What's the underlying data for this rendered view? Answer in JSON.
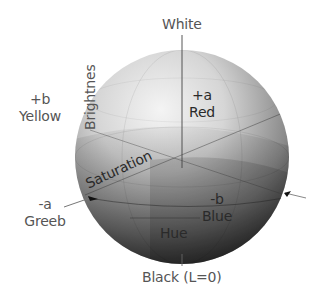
{
  "diagram": {
    "labels": {
      "white": "White",
      "black": "Black (L=0)",
      "plus_b_sign": "+b",
      "plus_b_name": "Yellow",
      "plus_a_sign": "+a",
      "plus_a_name": "Red",
      "minus_a_sign": "-a",
      "minus_a_name": "Greeb",
      "minus_b_sign": "-b",
      "minus_b_name": "Blue",
      "brightness": "Brightnes",
      "saturation": "Saturation",
      "hue": "Hue"
    },
    "colors": {
      "background": "#ffffff",
      "text": "#555555",
      "text_on_sphere": "#2a2a2a",
      "sphere_light": "#f2f2f2",
      "sphere_dark": "#2e2e2e",
      "axis": "#444444"
    }
  }
}
